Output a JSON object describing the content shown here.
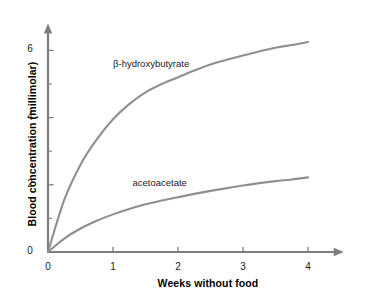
{
  "chart_data": {
    "type": "line",
    "title": "",
    "subtitle": "",
    "xlabel": "Weeks without food",
    "ylabel": "Blood concentration (millimolar)",
    "xlim": [
      0,
      4.55
    ],
    "ylim": [
      0,
      6.8
    ],
    "xticks": [
      0,
      1,
      2,
      3,
      4
    ],
    "xtick_labels": [
      "0",
      "1",
      "2",
      "3",
      "4"
    ],
    "yticks": [
      0,
      2,
      4,
      6
    ],
    "ytick_labels": [
      "0",
      "2",
      "4",
      "6"
    ],
    "y_minor_ticks": [
      1,
      3,
      5
    ],
    "grid": false,
    "legend_position": "inline-annotations",
    "axis_arrows": true,
    "line_color": "#8f8f8f",
    "axis_color": "#7d7d7d",
    "background": "#ffffff",
    "x": [
      0,
      0.25,
      0.5,
      0.75,
      1.0,
      1.25,
      1.5,
      1.75,
      2.0,
      2.25,
      2.5,
      2.75,
      3.0,
      3.25,
      3.5,
      3.75,
      4.0
    ],
    "series": [
      {
        "name": "β-hydroxybutyrate",
        "label_x": 1.0,
        "label_y": 5.6,
        "values": [
          0,
          1.55,
          2.6,
          3.35,
          3.95,
          4.4,
          4.75,
          5.0,
          5.2,
          5.4,
          5.58,
          5.72,
          5.85,
          5.97,
          6.08,
          6.16,
          6.25
        ]
      },
      {
        "name": "acetoacetate",
        "label_x": 1.3,
        "label_y": 2.05,
        "values": [
          0,
          0.4,
          0.7,
          0.93,
          1.12,
          1.28,
          1.42,
          1.53,
          1.63,
          1.73,
          1.82,
          1.9,
          1.98,
          2.05,
          2.11,
          2.16,
          2.22
        ]
      }
    ]
  }
}
